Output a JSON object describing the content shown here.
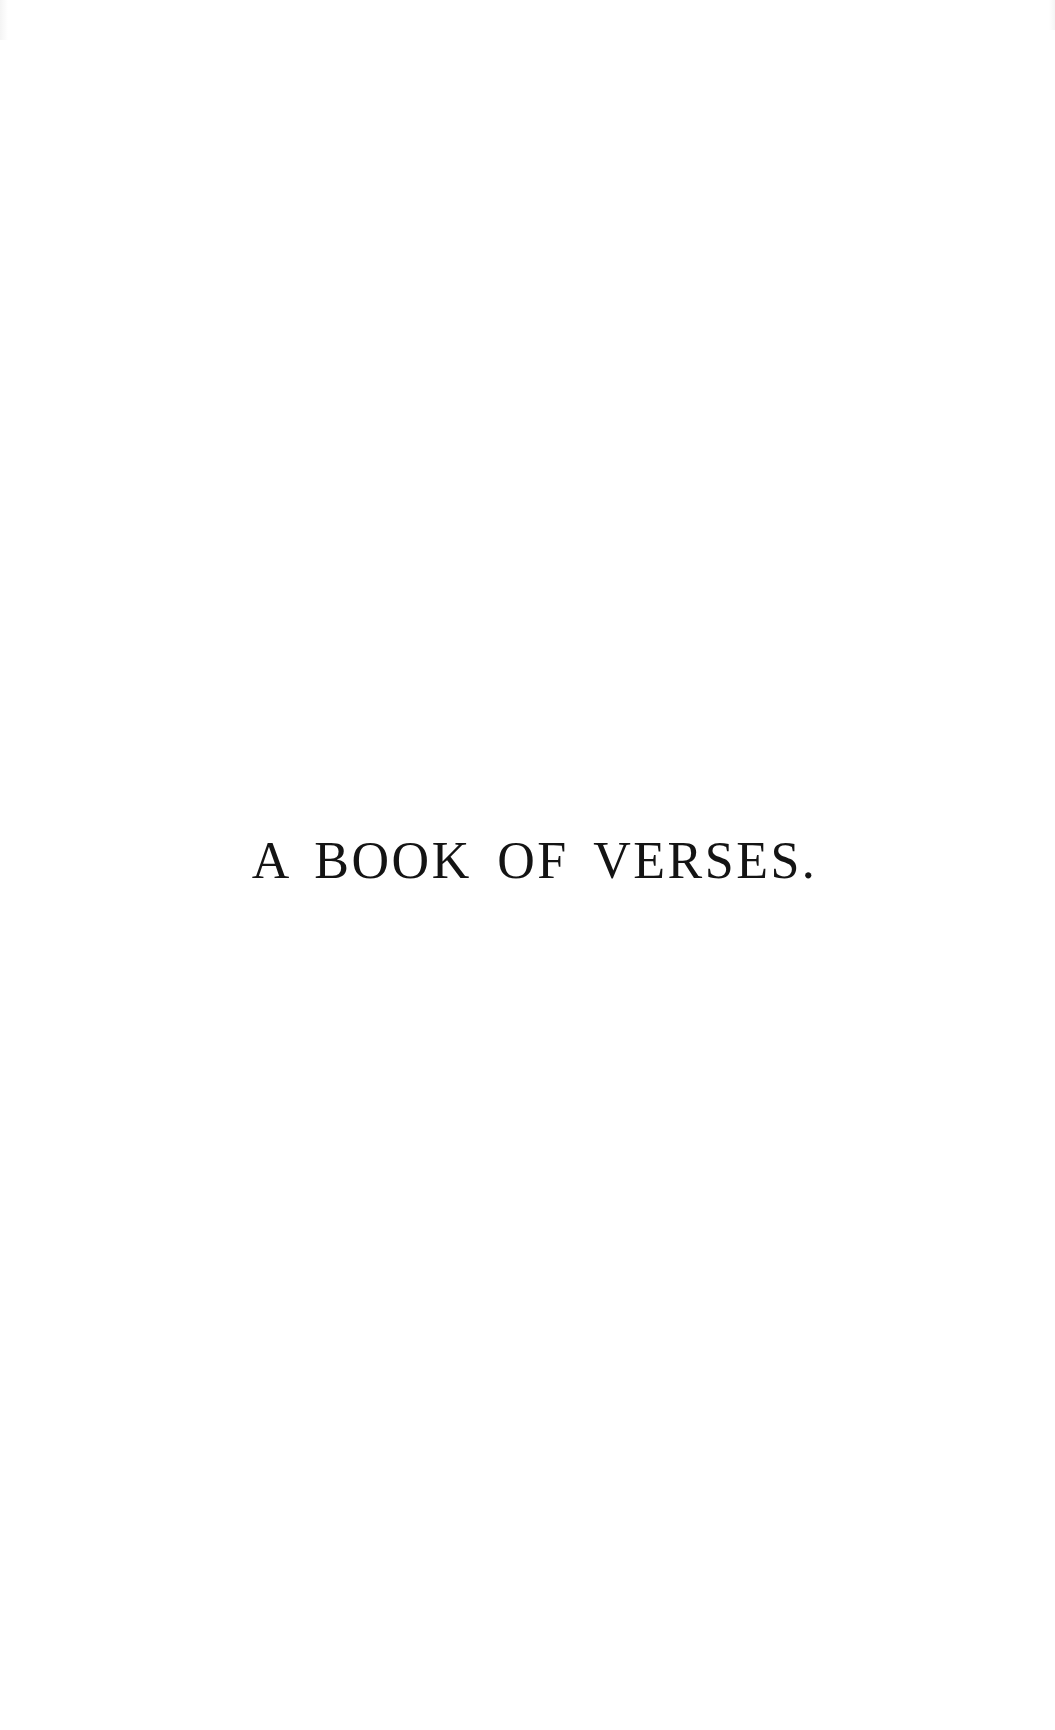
{
  "page": {
    "type": "half-title page",
    "title": "A BOOK OF VERSES.",
    "background_color": "#ffffff",
    "text_color": "#141414"
  }
}
